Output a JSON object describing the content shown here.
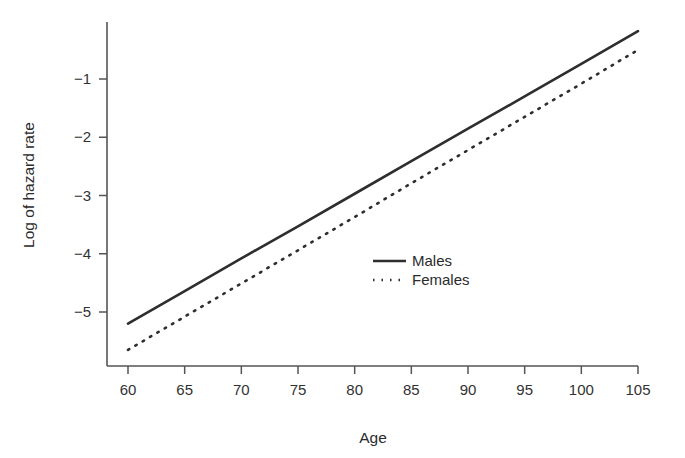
{
  "chart_data": {
    "type": "line",
    "title": "",
    "subtitle": "",
    "xlabel": "Age",
    "ylabel": "Log of hazard rate",
    "xlim": [
      58,
      107
    ],
    "ylim": [
      -5.9,
      0.05
    ],
    "xticks": [
      60,
      65,
      70,
      75,
      80,
      85,
      90,
      95,
      100,
      105
    ],
    "xtick_labels": [
      "60",
      "65",
      "70",
      "75",
      "80",
      "85",
      "90",
      "95",
      "100",
      "105"
    ],
    "yticks": [
      -1,
      -2,
      -3,
      -4,
      -5
    ],
    "ytick_labels": [
      "−1",
      "−2",
      "−3",
      "−4",
      "−5"
    ],
    "grid": false,
    "legend_position": "center-right",
    "x": [
      60,
      65,
      70,
      75,
      80,
      85,
      90,
      95,
      100,
      105
    ],
    "series": [
      {
        "name": "Males",
        "style": "solid",
        "color": "#2e2e2e",
        "values": [
          -5.2,
          -4.64,
          -4.08,
          -3.53,
          -2.97,
          -2.41,
          -1.85,
          -1.3,
          -0.74,
          -0.18
        ]
      },
      {
        "name": "Females",
        "style": "dotted",
        "color": "#2e2e2e",
        "values": [
          -5.65,
          -5.08,
          -4.51,
          -3.94,
          -3.37,
          -2.79,
          -2.22,
          -1.65,
          -1.08,
          -0.5
        ]
      }
    ],
    "annotations": []
  },
  "legend": {
    "entries": [
      {
        "label": "Males",
        "style": "solid"
      },
      {
        "label": "Females",
        "style": "dotted"
      }
    ]
  },
  "axes": {
    "x_title": "Age",
    "y_title": "Log of hazard rate"
  }
}
